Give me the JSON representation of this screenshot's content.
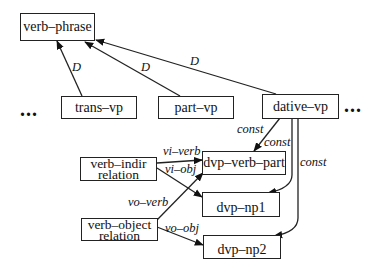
{
  "nodes": {
    "verb_phrase": "verb–phrase",
    "trans_vp": "trans–vp",
    "part_vp": "part–vp",
    "dative_vp": "dative–vp",
    "verb_indir": {
      "line1": "verb–indir",
      "line2": "relation"
    },
    "verb_object": {
      "line1": "verb–object",
      "line2": "relation"
    },
    "dvp_verb_part": "dvp–verb–part",
    "dvp_np1": "dvp–np1",
    "dvp_np2": "dvp–np2"
  },
  "ellipsis": {
    "left": "...",
    "right": "..."
  },
  "edge_labels": {
    "trans_to_vp": "D",
    "part_to_vp": "D",
    "dative_to_vp": "D",
    "const_verb_part": "const",
    "const_np1": "const",
    "const_np2": "const",
    "vi_verb": "vi–verb",
    "vi_obj": "vi–obj",
    "vo_verb": "vo–verb",
    "vo_obj": "vo–obj"
  },
  "colors": {
    "line": "#222222",
    "background": "#ffffff"
  }
}
